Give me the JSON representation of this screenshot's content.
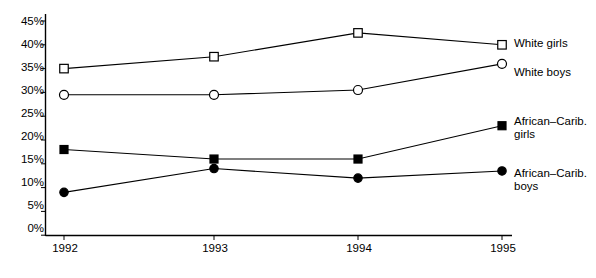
{
  "chart_data": {
    "type": "line",
    "title": "",
    "xlabel": "",
    "ylabel": "",
    "categories": [
      "1992",
      "1993",
      "1994",
      "1995"
    ],
    "x": [
      1992,
      1993,
      1994,
      1995
    ],
    "ylim": [
      0,
      45
    ],
    "ytick_labels": [
      "0%",
      "5%",
      "10%",
      "15%",
      "20%",
      "25%",
      "30%",
      "35%",
      "40%",
      "45%"
    ],
    "ytick_values": [
      0,
      5,
      10,
      15,
      20,
      25,
      30,
      35,
      40,
      45
    ],
    "grid": false,
    "legend_position": "right-inline",
    "series": [
      {
        "name": "White girls",
        "values": [
          35,
          37.5,
          42.5,
          40
        ],
        "marker": "open-square",
        "color": "#000000"
      },
      {
        "name": "White boys",
        "values": [
          29.5,
          29.5,
          30.5,
          36
        ],
        "marker": "open-circle",
        "color": "#000000"
      },
      {
        "name": "African–Carib.\ngirls",
        "values": [
          18,
          16,
          16,
          23
        ],
        "marker": "filled-square",
        "color": "#000000"
      },
      {
        "name": "African–Carib.\nboys",
        "values": [
          9,
          14,
          12,
          13.5
        ],
        "marker": "filled-circle",
        "color": "#000000"
      }
    ]
  },
  "axis": {
    "line_color": "#000000"
  }
}
